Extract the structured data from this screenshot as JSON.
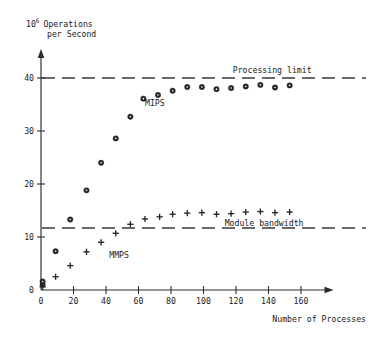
{
  "chart_data": {
    "type": "scatter",
    "title": "",
    "xlabel": "Number of Processes",
    "ylabel": "10^6 Operations per Second",
    "ylabel_parts": {
      "mantissa": "10",
      "exponent": "6",
      "line1": "Operations",
      "line2": "per Second"
    },
    "xlim": [
      0,
      172
    ],
    "ylim": [
      0,
      43
    ],
    "xticks": [
      0,
      20,
      40,
      60,
      80,
      100,
      120,
      140,
      160
    ],
    "yticks": [
      0,
      10,
      20,
      30,
      40
    ],
    "grid": false,
    "legend": "inline-annotations",
    "series": [
      {
        "name": "MIPS",
        "marker": "filled-circle",
        "label": "MIPS",
        "label_x": 64,
        "label_y": 35.2,
        "points": [
          {
            "x": 1,
            "y": 1.0
          },
          {
            "x": 1,
            "y": 1.6
          },
          {
            "x": 9,
            "y": 7.3
          },
          {
            "x": 18,
            "y": 13.3
          },
          {
            "x": 28,
            "y": 18.8
          },
          {
            "x": 37,
            "y": 24.0
          },
          {
            "x": 46,
            "y": 28.6
          },
          {
            "x": 55,
            "y": 32.7
          },
          {
            "x": 63,
            "y": 36.1
          },
          {
            "x": 72,
            "y": 36.8
          },
          {
            "x": 81,
            "y": 37.6
          },
          {
            "x": 90,
            "y": 38.3
          },
          {
            "x": 99,
            "y": 38.3
          },
          {
            "x": 108,
            "y": 37.9
          },
          {
            "x": 117,
            "y": 38.1
          },
          {
            "x": 126,
            "y": 38.4
          },
          {
            "x": 135,
            "y": 38.7
          },
          {
            "x": 144,
            "y": 38.2
          },
          {
            "x": 153,
            "y": 38.6
          }
        ]
      },
      {
        "name": "MMPS",
        "marker": "plus",
        "label": "MMPS",
        "label_x": 42,
        "label_y": 6.6,
        "points": [
          {
            "x": 1,
            "y": 0.6
          },
          {
            "x": 9,
            "y": 2.5
          },
          {
            "x": 18,
            "y": 4.6
          },
          {
            "x": 28,
            "y": 7.2
          },
          {
            "x": 37,
            "y": 9.0
          },
          {
            "x": 46,
            "y": 10.7
          },
          {
            "x": 55,
            "y": 12.4
          },
          {
            "x": 64,
            "y": 13.4
          },
          {
            "x": 73,
            "y": 13.8
          },
          {
            "x": 81,
            "y": 14.3
          },
          {
            "x": 90,
            "y": 14.5
          },
          {
            "x": 99,
            "y": 14.6
          },
          {
            "x": 108,
            "y": 14.3
          },
          {
            "x": 117,
            "y": 14.4
          },
          {
            "x": 126,
            "y": 14.7
          },
          {
            "x": 135,
            "y": 14.8
          },
          {
            "x": 144,
            "y": 14.6
          },
          {
            "x": 153,
            "y": 14.7
          }
        ]
      }
    ],
    "reference_lines": [
      {
        "name": "processing-limit",
        "label": "Processing limit",
        "value": 40,
        "style": "dashed",
        "label_x": 118,
        "label_y": 41.5
      },
      {
        "name": "module-bandwidth",
        "label": "Module bandwidth",
        "value": 11.7,
        "style": "dashed",
        "label_x": 113,
        "label_y": 12.6
      }
    ],
    "colors": {
      "marker": "#262626",
      "axis": "#2b2b2b",
      "reference": "#3a3a3a",
      "background": "#ffffff"
    }
  }
}
